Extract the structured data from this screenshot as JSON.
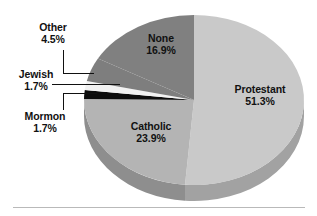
{
  "figure": {
    "background_color": "#ffffff",
    "baseline_rule_color": "#b9b9b9"
  },
  "chart_data": {
    "type": "pie",
    "title": "",
    "subtitle": "",
    "xlabel": "",
    "ylabel": "",
    "grid": false,
    "legend_position": "none",
    "style": "3d-exploded-none",
    "start_angle_deg": 0,
    "direction": "clockwise",
    "units": "percent",
    "total": 100,
    "categories": [
      "Protestant",
      "Catholic",
      "Mormon",
      "Jewish",
      "Other",
      "None"
    ],
    "values": [
      51.3,
      23.9,
      1.7,
      1.7,
      4.5,
      16.9
    ],
    "slices": [
      {
        "label": "Protestant",
        "value": 51.3,
        "value_text": "51.3%",
        "color": "#c9c9c9",
        "side_color": "#a2a2a2",
        "label_placement": "inside"
      },
      {
        "label": "Catholic",
        "value": 23.9,
        "value_text": "23.9%",
        "color": "#b4b4b4",
        "side_color": "#8e8e8e",
        "label_placement": "inside"
      },
      {
        "label": "Mormon",
        "value": 1.7,
        "value_text": "1.7%",
        "color": "#0d0d0d",
        "side_color": "#0d0d0d",
        "label_placement": "callout"
      },
      {
        "label": "Jewish",
        "value": 1.7,
        "value_text": "1.7%",
        "color": "#f2f2f2",
        "side_color": "#cfcfcf",
        "label_placement": "callout"
      },
      {
        "label": "Other",
        "value": 4.5,
        "value_text": "4.5%",
        "color": "#7e7e7e",
        "side_color": "#636363",
        "label_placement": "callout"
      },
      {
        "label": "None",
        "value": 16.9,
        "value_text": "16.9%",
        "color": "#808080",
        "side_color": "#656565",
        "label_placement": "inside"
      }
    ]
  },
  "labels": {
    "other": {
      "name": "Other",
      "pct": "4.5%"
    },
    "jewish": {
      "name": "Jewish",
      "pct": "1.7%"
    },
    "mormon": {
      "name": "Mormon",
      "pct": "1.7%"
    },
    "none": {
      "name": "None",
      "pct": "16.9%"
    },
    "protestant": {
      "name": "Protestant",
      "pct": "51.3%"
    },
    "catholic": {
      "name": "Catholic",
      "pct": "23.9%"
    }
  }
}
